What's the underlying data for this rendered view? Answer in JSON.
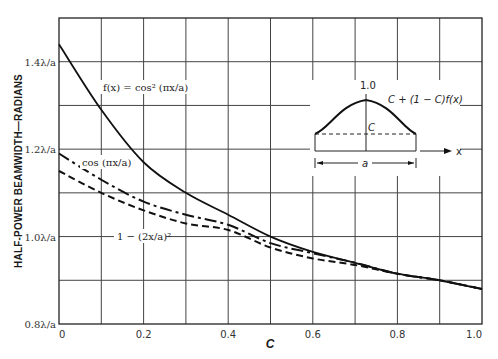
{
  "chart_data": {
    "type": "line",
    "title": "",
    "xlabel": "C",
    "ylabel": "HALF-POWER BEAMWIDTH—RADIANS",
    "xlim": [
      0,
      1.0
    ],
    "ylim": [
      0.8,
      1.5
    ],
    "grid": true,
    "x_ticks": [
      "0",
      "0.2",
      "0.4",
      "0.6",
      "0.8",
      "1.0"
    ],
    "y_ticks": [
      "0.8λ/a",
      "1.0λ/a",
      "1.2λ/a",
      "1.4λ/a"
    ],
    "x": [
      0,
      0.1,
      0.2,
      0.3,
      0.4,
      0.5,
      0.6,
      0.7,
      0.8,
      0.9,
      1.0
    ],
    "series": [
      {
        "name": "f(x) = cos²(πx/a)",
        "style": "solid",
        "values": [
          1.44,
          1.29,
          1.17,
          1.1,
          1.05,
          1.0,
          0.965,
          0.94,
          0.915,
          0.9,
          0.88
        ]
      },
      {
        "name": "cos(πx/a)",
        "style": "dash-dot",
        "values": [
          1.19,
          1.13,
          1.08,
          1.05,
          1.027,
          0.985,
          0.962,
          0.94,
          0.915,
          0.9,
          0.88
        ]
      },
      {
        "name": "1 − (2x/a)²",
        "style": "dashed",
        "values": [
          1.15,
          1.1,
          1.06,
          1.03,
          1.015,
          0.975,
          0.95,
          0.935,
          0.915,
          0.9,
          0.88
        ]
      }
    ],
    "annotations": [
      "f(x) = cos² (πx/a)",
      "cos (πx/a)",
      "1 − (2x/a)²"
    ],
    "inset": {
      "peak_label": "1.0",
      "curve_label": "C + (1 − C)f(x)",
      "pedestal_label": "C",
      "width_label": "a",
      "axis_label": "x"
    }
  }
}
